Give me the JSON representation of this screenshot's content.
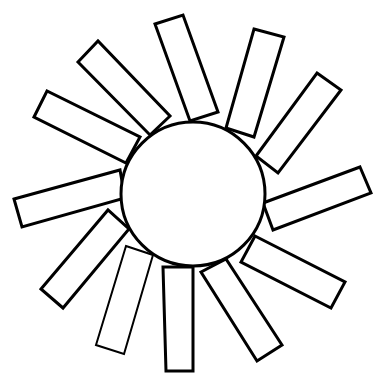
{
  "figure": {
    "title": "",
    "stroke_color": "#000000",
    "fill_color": "#ffffff",
    "ray_count": 12,
    "rays": [
      {
        "id": 1,
        "name": "ray-upper-left"
      },
      {
        "id": 2,
        "name": "ray-left-upper"
      },
      {
        "id": 3,
        "name": "ray-top"
      },
      {
        "id": 4,
        "name": "ray-top-right"
      },
      {
        "id": 5,
        "name": "ray-upper-right"
      },
      {
        "id": 6,
        "name": "ray-right"
      },
      {
        "id": 7,
        "name": "ray-lower-right"
      },
      {
        "id": 8,
        "name": "ray-bottom-right"
      },
      {
        "id": 9,
        "name": "ray-bottom"
      },
      {
        "id": 10,
        "name": "ray-bottom-left"
      },
      {
        "id": 11,
        "name": "ray-lower-left"
      },
      {
        "id": 12,
        "name": "ray-left"
      }
    ]
  }
}
